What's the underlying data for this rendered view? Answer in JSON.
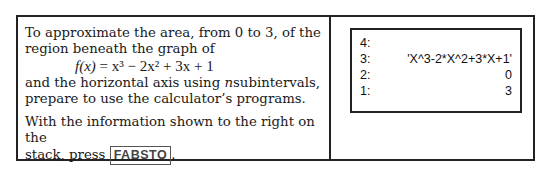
{
  "instruction": {
    "line1": "To approximate the area, from 0 to 3, of the",
    "line2": "region beneath the graph of",
    "formula": {
      "lhs": "f(x)",
      "rhs": "= x³ − 2x² + 3x + 1"
    },
    "line3a": "and the horizontal axis using ",
    "line3var": "n",
    "line3b": "subintervals,",
    "line4": "prepare to use the calculator’s programs.",
    "line5": "With the information shown to the right on the",
    "line6a": "stack, press ",
    "key": "FABSTO",
    "line6b": "."
  },
  "stack": [
    {
      "level": "4:",
      "value": ""
    },
    {
      "level": "3:",
      "value": "'X^3-2*X^2+3*X+1'"
    },
    {
      "level": "2:",
      "value": "0"
    },
    {
      "level": "1:",
      "value": "3"
    }
  ]
}
